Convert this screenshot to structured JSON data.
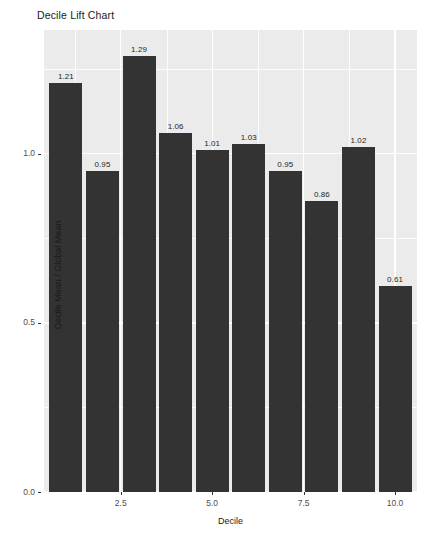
{
  "chart_data": {
    "type": "bar",
    "title": "Decile Lift Chart",
    "xlabel": "Decile",
    "ylabel": "Decile Mean / Global Mean",
    "categories": [
      1,
      2,
      3,
      4,
      5,
      6,
      7,
      8,
      9,
      10
    ],
    "values": [
      1.21,
      0.95,
      1.29,
      1.06,
      1.01,
      1.03,
      0.95,
      0.86,
      1.02,
      0.61
    ],
    "data_labels": [
      "1.21",
      "0.95",
      "1.29",
      "1.06",
      "1.01",
      "1.03",
      "0.95",
      "0.86",
      "1.02",
      "0.61"
    ],
    "xlim": [
      0.4,
      10.6
    ],
    "ylim": [
      0.0,
      1.366
    ],
    "x_ticks": [
      2.5,
      5.0,
      7.5,
      10.0
    ],
    "x_tick_labels": [
      "2.5",
      "5.0",
      "7.5",
      "10.0"
    ],
    "x_minor_ticks": [
      1.25,
      3.75,
      6.25,
      8.75
    ],
    "y_ticks": [
      0.0,
      0.5,
      1.0
    ],
    "y_tick_labels": [
      "0.0",
      "0.5",
      "1.0"
    ],
    "y_minor_ticks": [
      0.25,
      0.75,
      1.25
    ],
    "grid": true,
    "legend": null,
    "bar_color": "#333333",
    "panel_color": "#ebebeb",
    "grid_color": "#ffffff"
  }
}
